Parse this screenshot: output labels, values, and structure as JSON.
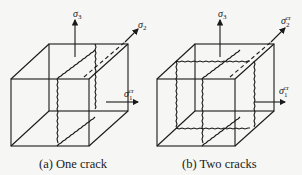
{
  "figure": {
    "panels": [
      {
        "id": "a",
        "caption": "(a)  One crack",
        "axes": {
          "vertical": {
            "symbol": "σ",
            "sub": "3",
            "sup": ""
          },
          "depth": {
            "symbol": "σ",
            "sub": "2",
            "sup": ""
          },
          "horizontal": {
            "symbol": "σ",
            "sub": "1",
            "sup": "cr"
          }
        },
        "cracks": 1
      },
      {
        "id": "b",
        "caption": "(b)  Two cracks",
        "axes": {
          "vertical": {
            "symbol": "σ",
            "sub": "3",
            "sup": ""
          },
          "depth": {
            "symbol": "σ",
            "sub": "2",
            "sup": "cr"
          },
          "horizontal": {
            "symbol": "σ",
            "sub": "1",
            "sup": "cr"
          }
        },
        "cracks": 2
      }
    ]
  }
}
